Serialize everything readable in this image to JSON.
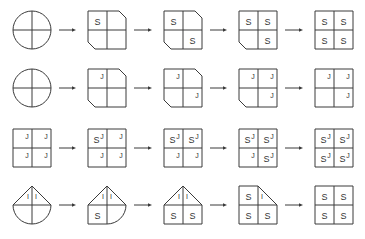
{
  "diagram": {
    "colors": {
      "line": "#3a3a3a",
      "text": "#333333",
      "background": "#ffffff"
    },
    "rows": [
      {
        "steps": [
          {
            "quadrants": {
              "tl": "round",
              "tr": "round",
              "bl": "round",
              "br": "round"
            },
            "labels": {}
          },
          {
            "quadrants": {
              "tl": "square",
              "tr": "cut",
              "bl": "cut",
              "br": "square"
            },
            "labels": {
              "tl": {
                "main": "S"
              }
            }
          },
          {
            "quadrants": {
              "tl": "square",
              "tr": "cut",
              "bl": "cut",
              "br": "square"
            },
            "labels": {
              "tl": {
                "main": "S"
              },
              "br": {
                "main": "S"
              }
            }
          },
          {
            "quadrants": {
              "tl": "square",
              "tr": "square",
              "bl": "cut",
              "br": "square"
            },
            "labels": {
              "tl": {
                "main": "S"
              },
              "tr": {
                "main": "S"
              },
              "br": {
                "main": "S"
              }
            }
          },
          {
            "quadrants": {
              "tl": "square",
              "tr": "square",
              "bl": "square",
              "br": "square"
            },
            "labels": {
              "tl": {
                "main": "S"
              },
              "tr": {
                "main": "S"
              },
              "bl": {
                "main": "S"
              },
              "br": {
                "main": "S"
              }
            }
          }
        ]
      },
      {
        "steps": [
          {
            "quadrants": {
              "tl": "round",
              "tr": "round",
              "bl": "round",
              "br": "round"
            },
            "labels": {}
          },
          {
            "quadrants": {
              "tl": "square",
              "tr": "cut",
              "bl": "cut",
              "br": "square"
            },
            "labels": {
              "tl": {
                "sup": "J"
              }
            }
          },
          {
            "quadrants": {
              "tl": "square",
              "tr": "cut",
              "bl": "cut",
              "br": "square"
            },
            "labels": {
              "tl": {
                "sup": "J"
              },
              "br": {
                "sup": "J"
              }
            }
          },
          {
            "quadrants": {
              "tl": "square",
              "tr": "square",
              "bl": "cut",
              "br": "square"
            },
            "labels": {
              "tl": {
                "sup": "J"
              },
              "tr": {
                "sup": "J"
              },
              "br": {
                "sup": "J"
              }
            }
          },
          {
            "quadrants": {
              "tl": "square",
              "tr": "square",
              "bl": "square",
              "br": "square"
            },
            "labels": {
              "tl": {
                "sup": "J"
              },
              "tr": {
                "sup": "J"
              },
              "br": {
                "sup": "J"
              }
            }
          }
        ]
      },
      {
        "steps": [
          {
            "quadrants": {
              "tl": "square",
              "tr": "square",
              "bl": "square",
              "br": "square"
            },
            "labels": {
              "tl": {
                "sup": "J"
              },
              "tr": {
                "sup": "J"
              },
              "bl": {
                "sup": "J"
              },
              "br": {
                "sup": "J"
              }
            }
          },
          {
            "quadrants": {
              "tl": "square",
              "tr": "square",
              "bl": "square",
              "br": "square"
            },
            "labels": {
              "tl": {
                "main": "S",
                "sup": "J"
              },
              "tr": {
                "sup": "J"
              },
              "bl": {
                "sup": "J"
              },
              "br": {
                "sup": "J"
              }
            }
          },
          {
            "quadrants": {
              "tl": "square",
              "tr": "square",
              "bl": "square",
              "br": "square"
            },
            "labels": {
              "tl": {
                "main": "S",
                "sup": "J"
              },
              "tr": {
                "main": "S",
                "sup": "J"
              },
              "bl": {
                "sup": "J"
              },
              "br": {
                "sup": "J"
              }
            }
          },
          {
            "quadrants": {
              "tl": "square",
              "tr": "square",
              "bl": "square",
              "br": "square"
            },
            "labels": {
              "tl": {
                "main": "S",
                "sup": "J"
              },
              "tr": {
                "main": "S",
                "sup": "J"
              },
              "bl": {
                "sup": "J"
              },
              "br": {
                "main": "S",
                "sup": "J"
              }
            }
          },
          {
            "quadrants": {
              "tl": "square",
              "tr": "square",
              "bl": "square",
              "br": "square"
            },
            "labels": {
              "tl": {
                "main": "S",
                "sup": "J"
              },
              "tr": {
                "main": "S",
                "sup": "J"
              },
              "bl": {
                "main": "S",
                "sup": "J"
              },
              "br": {
                "main": "S",
                "sup": "J"
              }
            }
          }
        ]
      },
      {
        "steps": [
          {
            "quadrants": {
              "tl": "triangle",
              "tr": "triangle",
              "bl": "round",
              "br": "round"
            },
            "labels": {
              "tl": {
                "mark": "I"
              },
              "tr": {
                "mark": "I"
              }
            }
          },
          {
            "quadrants": {
              "tl": "triangle",
              "tr": "triangle",
              "bl": "square",
              "br": "round"
            },
            "labels": {
              "tl": {
                "mark": "I"
              },
              "tr": {
                "mark": "I"
              },
              "bl": {
                "main": "S"
              }
            }
          },
          {
            "quadrants": {
              "tl": "triangle",
              "tr": "triangle",
              "bl": "square",
              "br": "square"
            },
            "labels": {
              "tl": {
                "mark": "I"
              },
              "tr": {
                "mark": "I"
              },
              "bl": {
                "main": "S"
              },
              "br": {
                "main": "S"
              }
            }
          },
          {
            "quadrants": {
              "tl": "square",
              "tr": "triangle",
              "bl": "square",
              "br": "square"
            },
            "labels": {
              "tl": {
                "main": "S"
              },
              "tr": {
                "mark": "I"
              },
              "bl": {
                "main": "S"
              },
              "br": {
                "main": "S"
              }
            }
          },
          {
            "quadrants": {
              "tl": "square",
              "tr": "square",
              "bl": "square",
              "br": "square"
            },
            "labels": {
              "tl": {
                "main": "S"
              },
              "tr": {
                "main": "S"
              },
              "bl": {
                "main": "S"
              },
              "br": {
                "main": "S"
              }
            }
          }
        ]
      }
    ]
  }
}
